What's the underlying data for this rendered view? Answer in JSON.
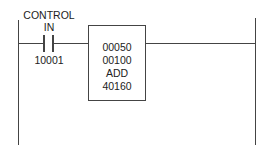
{
  "diagram": {
    "type": "ladder-logic-rung",
    "contact": {
      "label_line1": "CONTROL",
      "label_line2": "IN",
      "address": "10001",
      "type": "normally-open"
    },
    "function_block": {
      "line1": "00050",
      "line2": "00100",
      "operation": "ADD",
      "line4": "40160"
    },
    "colors": {
      "line": "#444444",
      "text": "#222222",
      "background": "#ffffff"
    }
  }
}
